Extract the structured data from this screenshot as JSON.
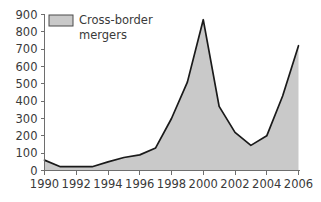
{
  "chart_data": {
    "type": "area",
    "title": "",
    "xlabel": "",
    "ylabel": "",
    "categories": [
      1990,
      1991,
      1992,
      1993,
      1994,
      1995,
      1996,
      1997,
      1998,
      1999,
      2000,
      2001,
      2002,
      2003,
      2004,
      2005,
      2006
    ],
    "values": [
      60,
      22,
      22,
      22,
      50,
      75,
      90,
      130,
      300,
      510,
      870,
      370,
      220,
      145,
      200,
      430,
      720
    ],
    "series": [
      {
        "name": "Cross-border mergers",
        "values": [
          60,
          22,
          22,
          22,
          50,
          75,
          90,
          130,
          300,
          510,
          870,
          370,
          220,
          145,
          200,
          430,
          720
        ]
      }
    ],
    "xlim": [
      1990,
      2006
    ],
    "ylim": [
      0,
      900
    ],
    "y_ticks": [
      0,
      100,
      200,
      300,
      400,
      500,
      600,
      700,
      800,
      900
    ],
    "y_tick_labels": [
      "0",
      "100",
      "200",
      "300",
      "400",
      "500",
      "600",
      "700",
      "800",
      "900"
    ],
    "x_ticks": [
      1990,
      1992,
      1994,
      1996,
      1998,
      2000,
      2002,
      2004,
      2006
    ],
    "x_tick_labels": [
      "1990",
      "1992",
      "1994",
      "1996",
      "1998",
      "2000",
      "2002",
      "2004",
      "2006"
    ],
    "grid": false,
    "legend_position": "top-left",
    "legend": [
      {
        "label_line1": "Cross-border",
        "label_line2": "mergers",
        "fill_color": "#c9c9c9",
        "border_color": "#4a4a4a"
      }
    ],
    "colors": {
      "area_fill": "#c9c9c9",
      "area_stroke": "#1a1a1a",
      "axis": "#6e6e6e",
      "text": "#3a3a3a",
      "background": "#ffffff"
    }
  }
}
